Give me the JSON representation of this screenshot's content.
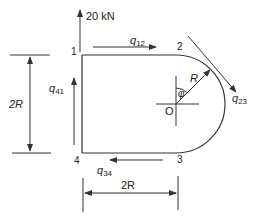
{
  "figure": {
    "colors": {
      "line": "#333333",
      "text": "#222222",
      "background": "#ffffff"
    },
    "load": {
      "label": "20 kN",
      "direction": "up",
      "at_node": "1"
    },
    "nodes": {
      "n1": "1",
      "n2": "2",
      "n3": "3",
      "n4": "4",
      "center": "O"
    },
    "shear_flows": {
      "q12": {
        "symbol": "q",
        "sub": "12"
      },
      "q23": {
        "symbol": "q",
        "sub": "23"
      },
      "q34": {
        "symbol": "q",
        "sub": "34"
      },
      "q41": {
        "symbol": "q",
        "sub": "41"
      }
    },
    "dimensions": {
      "height": "2R",
      "width": "2R",
      "radius": "R",
      "angle": "φ"
    }
  }
}
